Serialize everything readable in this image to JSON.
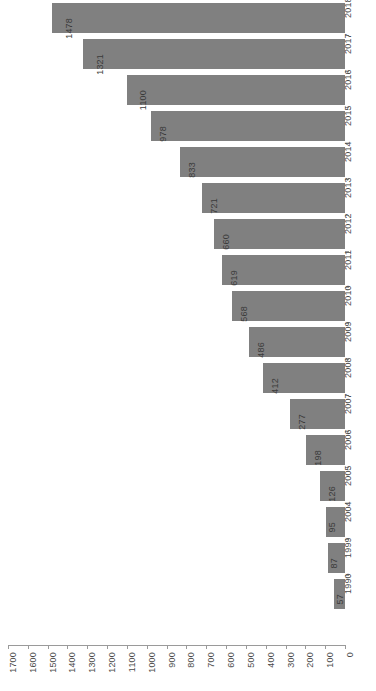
{
  "chart_data": {
    "type": "bar",
    "orientation": "horizontal-rotated",
    "title": "",
    "subtitle": "",
    "xlabel": "",
    "ylabel": "",
    "grid": false,
    "legend": null,
    "xlim": [
      0,
      1700
    ],
    "x_axis_reversed": true,
    "x_tick_step": 100,
    "bar_color": "#808080",
    "background_color": "#ffffff",
    "axis_color": "#9a9a9a",
    "text_color": "#4a4a4a",
    "categories": [
      "2018",
      "2017",
      "2016",
      "2015",
      "2014",
      "2013",
      "2012",
      "2011",
      "2010",
      "2009",
      "2008",
      "2007",
      "2006",
      "2005",
      "2004",
      "1999",
      "1990"
    ],
    "values": [
      1478,
      1321,
      1100,
      978,
      833,
      721,
      660,
      619,
      568,
      486,
      412,
      277,
      198,
      126,
      95,
      87,
      57
    ],
    "xticks": [
      "1700",
      "1600",
      "1500",
      "1400",
      "1300",
      "1200",
      "1100",
      "1000",
      "900",
      "800",
      "700",
      "600",
      "500",
      "400",
      "300",
      "200",
      "100",
      "0"
    ],
    "xtick_values": [
      1700,
      1600,
      1500,
      1400,
      1300,
      1200,
      1100,
      1000,
      900,
      800,
      700,
      600,
      500,
      400,
      300,
      200,
      100,
      0
    ]
  }
}
